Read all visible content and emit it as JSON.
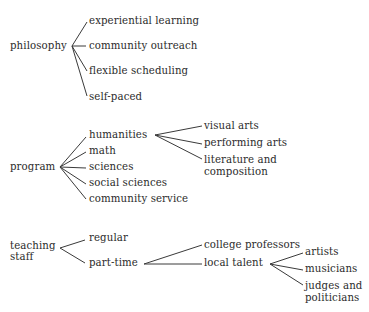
{
  "diagram": {
    "type": "tree-map",
    "groups": [
      {
        "label": "philosophy",
        "children": [
          {
            "label": "experiential learning"
          },
          {
            "label": "community outreach"
          },
          {
            "label": "flexible scheduling"
          },
          {
            "label": "self-paced"
          }
        ]
      },
      {
        "label": "program",
        "children": [
          {
            "label": "humanities",
            "children": [
              {
                "label": "visual arts"
              },
              {
                "label": "performing arts"
              },
              {
                "label": "literature and composition",
                "line1": "literature and",
                "line2": "composition"
              }
            ]
          },
          {
            "label": "math"
          },
          {
            "label": "sciences"
          },
          {
            "label": "social sciences"
          },
          {
            "label": "community service"
          }
        ]
      },
      {
        "label": "teaching staff",
        "line1": "teaching",
        "line2": "staff",
        "children": [
          {
            "label": "regular"
          },
          {
            "label": "part-time",
            "children": [
              {
                "label": "college professors"
              },
              {
                "label": "local talent",
                "children": [
                  {
                    "label": "artists"
                  },
                  {
                    "label": "musicians"
                  },
                  {
                    "label": "judges and politicians",
                    "line1": "judges and",
                    "line2": "politicians"
                  }
                ]
              }
            ]
          }
        ]
      }
    ]
  },
  "colors": {
    "text": "#2b2b2b",
    "lines": "#3a3a3a",
    "background": "#ffffff"
  }
}
